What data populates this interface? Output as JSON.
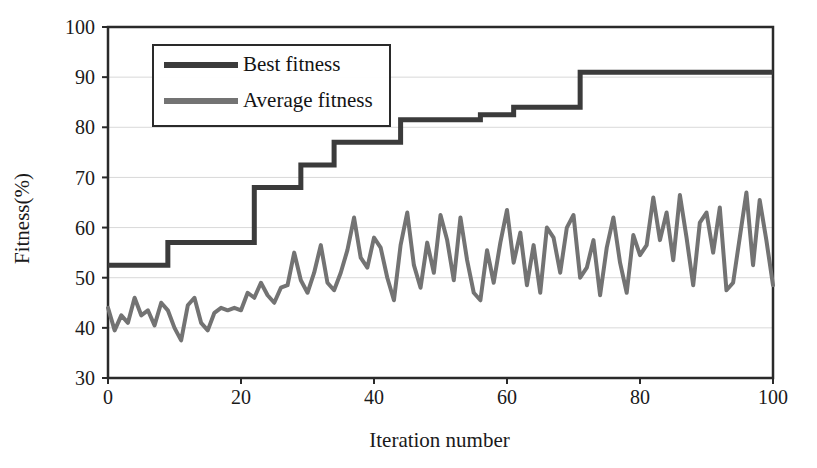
{
  "chart_data": {
    "type": "line",
    "title": "",
    "xlabel": "Iteration number",
    "ylabel": "Fitness(%)",
    "xlim": [
      0,
      100
    ],
    "ylim": [
      30,
      100
    ],
    "xticks": [
      0,
      20,
      40,
      60,
      80,
      100
    ],
    "yticks": [
      30,
      40,
      50,
      60,
      70,
      80,
      90,
      100
    ],
    "grid": true,
    "grid_axis": "y",
    "legend_position": "upper-left-inside",
    "x": [
      0,
      1,
      2,
      3,
      4,
      5,
      6,
      7,
      8,
      9,
      10,
      11,
      12,
      13,
      14,
      15,
      16,
      17,
      18,
      19,
      20,
      21,
      22,
      23,
      24,
      25,
      26,
      27,
      28,
      29,
      30,
      31,
      32,
      33,
      34,
      35,
      36,
      37,
      38,
      39,
      40,
      41,
      42,
      43,
      44,
      45,
      46,
      47,
      48,
      49,
      50,
      51,
      52,
      53,
      54,
      55,
      56,
      57,
      58,
      59,
      60,
      61,
      62,
      63,
      64,
      65,
      66,
      67,
      68,
      69,
      70,
      71,
      72,
      73,
      74,
      75,
      76,
      77,
      78,
      79,
      80,
      81,
      82,
      83,
      84,
      85,
      86,
      87,
      88,
      89,
      90,
      91,
      92,
      93,
      94,
      95,
      96,
      97,
      98,
      99,
      100
    ],
    "series": [
      {
        "name": "Best fitness",
        "color": "#3b3b3b",
        "width": 5,
        "values": [
          52.5,
          52.5,
          52.5,
          52.5,
          52.5,
          52.5,
          52.5,
          52.5,
          52.5,
          57.0,
          57.0,
          57.0,
          57.0,
          57.0,
          57.0,
          57.0,
          57.0,
          57.0,
          57.0,
          57.0,
          57.0,
          57.0,
          68.0,
          68.0,
          68.0,
          68.0,
          68.0,
          68.0,
          68.0,
          72.5,
          72.5,
          72.5,
          72.5,
          72.5,
          77.0,
          77.0,
          77.0,
          77.0,
          77.0,
          77.0,
          77.0,
          77.0,
          77.0,
          77.0,
          81.5,
          81.5,
          81.5,
          81.5,
          81.5,
          81.5,
          81.5,
          81.5,
          81.5,
          81.5,
          81.5,
          81.5,
          82.5,
          82.5,
          82.5,
          82.5,
          82.5,
          84.0,
          84.0,
          84.0,
          84.0,
          84.0,
          84.0,
          84.0,
          84.0,
          84.0,
          84.0,
          91.0,
          91.0,
          91.0,
          91.0,
          91.0,
          91.0,
          91.0,
          91.0,
          91.0,
          91.0,
          91.0,
          91.0,
          91.0,
          91.0,
          91.0,
          91.0,
          91.0,
          91.0,
          91.0,
          91.0,
          91.0,
          91.0,
          91.0,
          91.0,
          91.0,
          91.0,
          91.0,
          91.0,
          91.0,
          91.0
        ]
      },
      {
        "name": "Average fitness",
        "color": "#737373",
        "width": 4,
        "values": [
          44.0,
          39.5,
          42.5,
          41.0,
          46.0,
          42.5,
          43.5,
          40.5,
          45.0,
          43.5,
          40.0,
          37.5,
          44.5,
          46.0,
          41.0,
          39.5,
          43.0,
          44.0,
          43.5,
          44.0,
          43.5,
          47.0,
          46.0,
          49.0,
          46.5,
          45.0,
          48.0,
          48.5,
          55.0,
          49.5,
          47.0,
          51.0,
          56.5,
          49.0,
          47.5,
          51.0,
          55.5,
          62.0,
          54.0,
          52.0,
          58.0,
          56.0,
          50.0,
          45.5,
          56.5,
          63.0,
          52.5,
          48.0,
          57.0,
          51.0,
          62.5,
          57.5,
          49.5,
          62.0,
          53.5,
          47.0,
          45.5,
          55.5,
          49.0,
          57.0,
          63.5,
          53.0,
          59.0,
          48.5,
          56.5,
          47.0,
          60.0,
          58.0,
          51.0,
          60.0,
          62.5,
          50.0,
          52.0,
          57.5,
          46.5,
          56.0,
          62.0,
          53.0,
          47.0,
          58.5,
          54.5,
          56.5,
          66.0,
          57.5,
          63.0,
          53.5,
          66.5,
          58.0,
          48.5,
          61.0,
          63.0,
          55.0,
          64.0,
          47.5,
          49.0,
          58.0,
          67.0,
          52.5,
          65.5,
          57.5,
          48.5
        ]
      }
    ]
  },
  "legend": {
    "items": [
      {
        "label": "Best fitness",
        "color": "#3b3b3b"
      },
      {
        "label": "Average fitness",
        "color": "#737373"
      }
    ]
  },
  "axes": {
    "ylabel": "Fitness(%)",
    "xlabel": "Iteration number",
    "ytick_labels": [
      "100",
      "90",
      "80",
      "70",
      "60",
      "50",
      "40",
      "30"
    ],
    "xtick_labels": [
      "0",
      "20",
      "40",
      "60",
      "80",
      "100"
    ]
  },
  "style": {
    "frame_color": "#2a2a2a",
    "grid_color": "#d9d9d9",
    "text_color": "#1a1a1a",
    "background": "#ffffff"
  }
}
